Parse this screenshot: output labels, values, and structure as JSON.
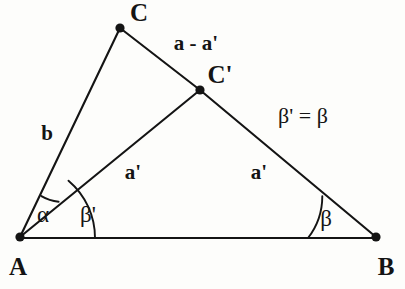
{
  "figure": {
    "type": "geometry-diagram",
    "background_color": "#fdfdfb",
    "stroke_color": "#141414",
    "width": 405,
    "height": 289
  },
  "vertices": [
    {
      "id": "A",
      "label": "A",
      "x": 20,
      "y": 237,
      "label_x": 18,
      "label_y": 266,
      "dot": true
    },
    {
      "id": "B",
      "label": "B",
      "x": 376,
      "y": 237,
      "label_x": 386,
      "label_y": 266,
      "dot": true
    },
    {
      "id": "C",
      "label": "C",
      "x": 120,
      "y": 28,
      "label_x": 139,
      "label_y": 12,
      "dot": true
    },
    {
      "id": "Cprime",
      "label": "C'",
      "x": 200,
      "y": 90,
      "label_x": 220,
      "label_y": 74,
      "dot": true
    }
  ],
  "segments": [
    {
      "id": "AB",
      "from": "A",
      "to": "B",
      "x1": 20,
      "y1": 238,
      "x2": 376,
      "y2": 238
    },
    {
      "id": "AC",
      "from": "A",
      "to": "C",
      "x1": 20,
      "y1": 237,
      "x2": 120,
      "y2": 28
    },
    {
      "id": "ACprime",
      "from": "A",
      "to": "Cprime",
      "x1": 20,
      "y1": 237,
      "x2": 200,
      "y2": 90
    },
    {
      "id": "CCprime",
      "from": "C",
      "to": "Cprime",
      "x1": 120,
      "y1": 28,
      "x2": 200,
      "y2": 90
    },
    {
      "id": "CprimeB",
      "from": "Cprime",
      "to": "B",
      "x1": 200,
      "y1": 90,
      "x2": 376,
      "y2": 237
    }
  ],
  "side_labels": [
    {
      "id": "b",
      "text": "b",
      "x": 47,
      "y": 133
    },
    {
      "id": "a_minus",
      "text": "a - a'",
      "x": 196,
      "y": 43
    },
    {
      "id": "a_prime1",
      "text": "a'",
      "x": 133,
      "y": 172
    },
    {
      "id": "a_prime2",
      "text": "a'",
      "x": 259,
      "y": 172
    }
  ],
  "angle_labels": [
    {
      "id": "alpha",
      "text": "α",
      "x": 43,
      "y": 214
    },
    {
      "id": "beta_prime",
      "text": "β'",
      "x": 88,
      "y": 214
    },
    {
      "id": "beta",
      "text": "β",
      "x": 326,
      "y": 218
    }
  ],
  "relations": [
    {
      "id": "beta_equality",
      "text": "β' = β",
      "x": 303,
      "y": 116
    }
  ],
  "angle_arcs": [
    {
      "id": "arc-alpha",
      "path": "M 58.6 201.7 A 42 42 0 0 1 41.4 196.1",
      "note": "alpha at A between AC' and AC, radius 42"
    },
    {
      "id": "arc-beta-prime",
      "path": "M 95 238 A 75 75 0 0 0 68.5 180.7",
      "note": "beta prime at A between AB and AC', radius 75"
    },
    {
      "id": "arc-beta",
      "path": "M 308 238 A 68 68 0 0 0 322.3 196.2",
      "note": "beta at B between BA and BC', radius 68"
    }
  ]
}
